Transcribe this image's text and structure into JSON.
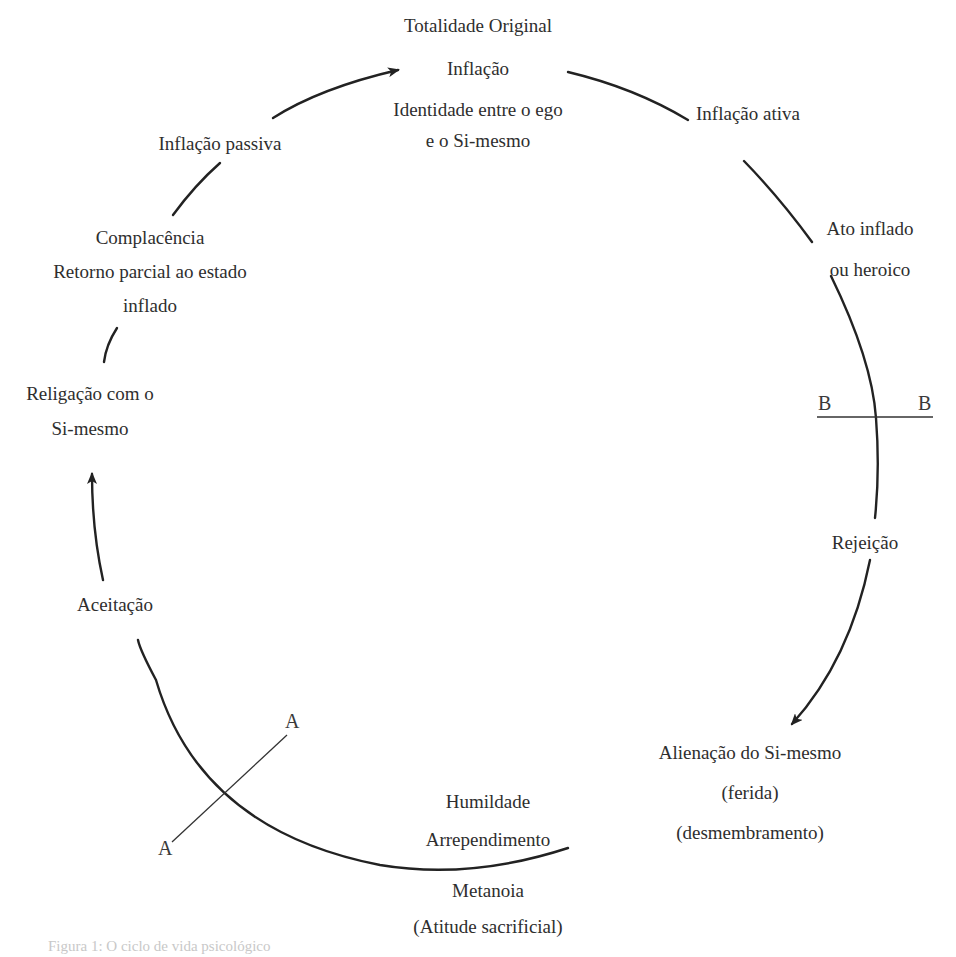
{
  "diagram": {
    "type": "cycle",
    "stroke_color": "#222222",
    "text_color": "#2e2e2e",
    "nodes": {
      "top": {
        "lines": [
          "Totalidade Original",
          "Inflação",
          "Identidade entre o ego",
          "e o Si-mesmo"
        ]
      },
      "inflacao_ativa": {
        "lines": [
          "Inflação ativa"
        ]
      },
      "ato_inflado": {
        "lines": [
          "Ato inflado",
          "ou heroico"
        ]
      },
      "rejeicao": {
        "lines": [
          "Rejeição"
        ]
      },
      "alienacao": {
        "lines": [
          "Alienação do Si-mesmo",
          "(ferida)",
          "(desmembramento)"
        ]
      },
      "humildade": {
        "lines": [
          "Humildade",
          "Arrependimento"
        ]
      },
      "metanoia": {
        "lines": [
          "Metanoia",
          "(Atitude sacrificial)"
        ]
      },
      "aceitacao": {
        "lines": [
          "Aceitação"
        ]
      },
      "religacao": {
        "lines": [
          "Religação com o",
          "Si-mesmo"
        ]
      },
      "complacencia": {
        "lines": [
          "Complacência",
          "Retorno parcial ao estado",
          "inflado"
        ]
      },
      "inflacao_passiva": {
        "lines": [
          "Inflação passiva"
        ]
      }
    },
    "axes": {
      "A": {
        "label_start": "A",
        "label_end": "A"
      },
      "B": {
        "label_start": "B",
        "label_end": "B"
      }
    },
    "caption": "Figura 1: O ciclo de vida psicológico"
  }
}
